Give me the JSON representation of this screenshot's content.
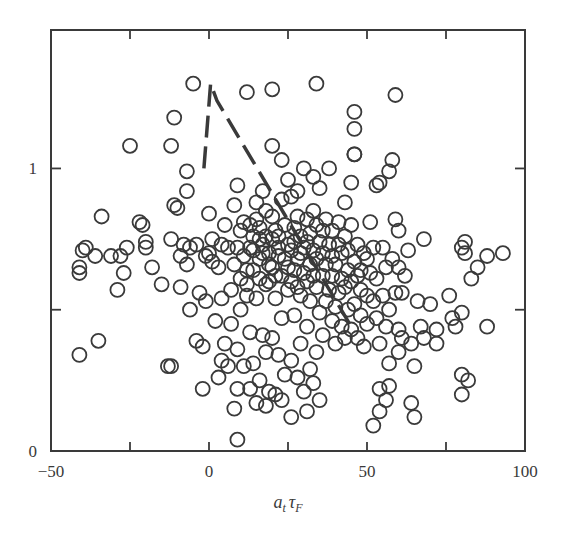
{
  "chart_data": {
    "type": "scatter",
    "title": "",
    "xlabel": "a_t τ_F",
    "xlabel_main": "a",
    "xlabel_sub1": "t",
    "xlabel_tau": "τ",
    "xlabel_sub2": "F",
    "ylabel": "",
    "xlim": [
      -50,
      100
    ],
    "ylim": [
      0,
      1.49
    ],
    "grid": false,
    "legend": null,
    "x_ticks": [
      -50,
      -25,
      0,
      25,
      50,
      75,
      100
    ],
    "x_tick_labels": [
      "-50",
      "",
      "0",
      "",
      "50",
      "",
      "100"
    ],
    "y_ticks": [
      0,
      0.5,
      1
    ],
    "y_tick_labels": [
      "0",
      "",
      "1"
    ],
    "marker": "open-circle",
    "marker_color": "#3a3a3a",
    "series": [
      {
        "name": "observations",
        "style": "open-circle",
        "points": [
          [
            -41,
            0.34
          ],
          [
            -35,
            0.39
          ],
          [
            -41,
            0.63
          ],
          [
            -41,
            0.65
          ],
          [
            -40,
            0.71
          ],
          [
            -39,
            0.72
          ],
          [
            -36,
            0.69
          ],
          [
            -34,
            0.83
          ],
          [
            -31,
            0.69
          ],
          [
            -29,
            0.57
          ],
          [
            -28,
            0.69
          ],
          [
            -27,
            0.63
          ],
          [
            -26,
            0.72
          ],
          [
            -25,
            1.08
          ],
          [
            -22,
            0.81
          ],
          [
            -21,
            0.8
          ],
          [
            -20,
            0.72
          ],
          [
            -20,
            0.74
          ],
          [
            -18,
            0.65
          ],
          [
            -15,
            0.59
          ],
          [
            -13,
            0.3
          ],
          [
            -12,
            0.3
          ],
          [
            -12,
            0.75
          ],
          [
            -12,
            1.08
          ],
          [
            -11,
            0.87
          ],
          [
            -11,
            1.18
          ],
          [
            -10,
            0.86
          ],
          [
            -9,
            0.58
          ],
          [
            -9,
            0.69
          ],
          [
            -8,
            0.73
          ],
          [
            -7,
            0.66
          ],
          [
            -7,
            0.92
          ],
          [
            -7,
            0.99
          ],
          [
            -6,
            0.5
          ],
          [
            -6,
            0.72
          ],
          [
            -5,
            1.3
          ],
          [
            -4,
            0.73
          ],
          [
            -4,
            0.39
          ],
          [
            -3,
            0.56
          ],
          [
            -2,
            0.22
          ],
          [
            -2,
            0.37
          ],
          [
            -1,
            0.53
          ],
          [
            -1,
            0.69
          ],
          [
            0,
            0.84
          ],
          [
            0,
            0.7
          ],
          [
            1,
            0.75
          ],
          [
            1,
            0.67
          ],
          [
            2,
            0.46
          ],
          [
            3,
            0.26
          ],
          [
            3,
            0.65
          ],
          [
            4,
            0.54
          ],
          [
            4,
            0.32
          ],
          [
            4,
            0.73
          ],
          [
            5,
            0.38
          ],
          [
            5,
            0.8
          ],
          [
            6,
            0.3
          ],
          [
            6,
            0.72
          ],
          [
            7,
            0.45
          ],
          [
            7,
            0.57
          ],
          [
            8,
            0.15
          ],
          [
            8,
            0.66
          ],
          [
            8,
            0.87
          ],
          [
            9,
            0.04
          ],
          [
            9,
            0.22
          ],
          [
            9,
            0.36
          ],
          [
            9,
            0.72
          ],
          [
            9,
            0.94
          ],
          [
            10,
            0.5
          ],
          [
            10,
            0.61
          ],
          [
            10,
            0.78
          ],
          [
            11,
            0.81
          ],
          [
            11,
            0.3
          ],
          [
            11,
            0.69
          ],
          [
            12,
            0.55
          ],
          [
            12,
            0.59
          ],
          [
            12,
            0.64
          ],
          [
            12,
            1.27
          ],
          [
            13,
            0.22
          ],
          [
            13,
            0.42
          ],
          [
            13,
            0.72
          ],
          [
            13,
            0.8
          ],
          [
            14,
            0.31
          ],
          [
            14,
            0.64
          ],
          [
            14,
            0.71
          ],
          [
            14,
            0.76
          ],
          [
            15,
            0.17
          ],
          [
            15,
            0.54
          ],
          [
            15,
            0.82
          ],
          [
            15,
            0.88
          ],
          [
            16,
            0.25
          ],
          [
            16,
            0.61
          ],
          [
            16,
            0.68
          ],
          [
            16,
            0.75
          ],
          [
            16,
            0.79
          ],
          [
            17,
            0.41
          ],
          [
            17,
            0.7
          ],
          [
            17,
            0.73
          ],
          [
            17,
            0.92
          ],
          [
            18,
            0.16
          ],
          [
            18,
            0.35
          ],
          [
            18,
            0.59
          ],
          [
            18,
            0.76
          ],
          [
            18,
            0.85
          ],
          [
            19,
            0.21
          ],
          [
            19,
            0.6
          ],
          [
            19,
            0.66
          ],
          [
            19,
            0.7
          ],
          [
            20,
            0.4
          ],
          [
            20,
            0.65
          ],
          [
            20,
            0.75
          ],
          [
            20,
            0.83
          ],
          [
            20,
            1.08
          ],
          [
            20,
            1.28
          ],
          [
            21,
            0.2
          ],
          [
            21,
            0.54
          ],
          [
            21,
            0.62
          ],
          [
            21,
            0.78
          ],
          [
            22,
            0.34
          ],
          [
            22,
            0.69
          ],
          [
            22,
            0.72
          ],
          [
            22,
            0.76
          ],
          [
            23,
            0.18
          ],
          [
            23,
            0.47
          ],
          [
            23,
            0.62
          ],
          [
            23,
            0.89
          ],
          [
            23,
            1.03
          ],
          [
            24,
            0.27
          ],
          [
            24,
            0.68
          ],
          [
            24,
            0.8
          ],
          [
            25,
            0.57
          ],
          [
            25,
            0.65
          ],
          [
            25,
            0.73
          ],
          [
            25,
            0.96
          ],
          [
            26,
            0.12
          ],
          [
            26,
            0.32
          ],
          [
            26,
            0.6
          ],
          [
            26,
            0.71
          ],
          [
            26,
            0.9
          ],
          [
            27,
            0.48
          ],
          [
            27,
            0.64
          ],
          [
            27,
            0.74
          ],
          [
            27,
            0.79
          ],
          [
            28,
            0.26
          ],
          [
            28,
            0.58
          ],
          [
            28,
            0.68
          ],
          [
            28,
            0.83
          ],
          [
            28,
            0.92
          ],
          [
            29,
            0.38
          ],
          [
            29,
            0.55
          ],
          [
            29,
            0.7
          ],
          [
            29,
            0.76
          ],
          [
            30,
            0.21
          ],
          [
            30,
            0.63
          ],
          [
            30,
            0.72
          ],
          [
            30,
            1.0
          ],
          [
            31,
            0.14
          ],
          [
            31,
            0.44
          ],
          [
            31,
            0.6
          ],
          [
            31,
            0.74
          ],
          [
            31,
            0.82
          ],
          [
            32,
            0.29
          ],
          [
            32,
            0.53
          ],
          [
            32,
            0.66
          ],
          [
            32,
            0.77
          ],
          [
            33,
            0.24
          ],
          [
            33,
            0.62
          ],
          [
            33,
            0.71
          ],
          [
            33,
            0.85
          ],
          [
            33,
            0.97
          ],
          [
            34,
            0.35
          ],
          [
            34,
            0.58
          ],
          [
            34,
            0.68
          ],
          [
            34,
            0.8
          ],
          [
            34,
            1.3
          ],
          [
            35,
            0.18
          ],
          [
            35,
            0.49
          ],
          [
            35,
            0.74
          ],
          [
            35,
            0.93
          ],
          [
            36,
            0.41
          ],
          [
            36,
            0.62
          ],
          [
            36,
            0.7
          ],
          [
            36,
            0.78
          ],
          [
            37,
            0.53
          ],
          [
            37,
            0.66
          ],
          [
            37,
            0.82
          ],
          [
            38,
            0.57
          ],
          [
            38,
            0.73
          ],
          [
            38,
            1.0
          ],
          [
            39,
            0.46
          ],
          [
            39,
            0.62
          ],
          [
            39,
            0.69
          ],
          [
            39,
            0.78
          ],
          [
            40,
            0.38
          ],
          [
            40,
            0.51
          ],
          [
            40,
            0.66
          ],
          [
            41,
            0.56
          ],
          [
            41,
            0.73
          ],
          [
            41,
            0.81
          ],
          [
            42,
            0.44
          ],
          [
            42,
            0.61
          ],
          [
            42,
            0.7
          ],
          [
            43,
            0.4
          ],
          [
            43,
            0.58
          ],
          [
            43,
            0.76
          ],
          [
            43,
            0.88
          ],
          [
            44,
            0.5
          ],
          [
            44,
            0.64
          ],
          [
            44,
            0.71
          ],
          [
            45,
            0.43
          ],
          [
            45,
            0.6
          ],
          [
            45,
            0.8
          ],
          [
            45,
            0.95
          ],
          [
            46,
            0.52
          ],
          [
            46,
            0.67
          ],
          [
            46,
            1.05
          ],
          [
            46,
            1.05
          ],
          [
            46,
            1.14
          ],
          [
            46,
            1.2
          ],
          [
            47,
            0.4
          ],
          [
            47,
            0.62
          ],
          [
            47,
            0.73
          ],
          [
            48,
            0.48
          ],
          [
            48,
            0.57
          ],
          [
            48,
            0.64
          ],
          [
            49,
            0.37
          ],
          [
            49,
            0.7
          ],
          [
            50,
            0.45
          ],
          [
            50,
            0.55
          ],
          [
            50,
            0.68
          ],
          [
            51,
            0.63
          ],
          [
            51,
            0.81
          ],
          [
            52,
            0.09
          ],
          [
            52,
            0.53
          ],
          [
            52,
            0.72
          ],
          [
            53,
            0.47
          ],
          [
            53,
            0.61
          ],
          [
            53,
            0.94
          ],
          [
            54,
            0.14
          ],
          [
            54,
            0.22
          ],
          [
            54,
            0.38
          ],
          [
            54,
            0.95
          ],
          [
            55,
            0.55
          ],
          [
            55,
            0.72
          ],
          [
            56,
            0.18
          ],
          [
            56,
            0.44
          ],
          [
            56,
            0.65
          ],
          [
            57,
            0.23
          ],
          [
            57,
            0.31
          ],
          [
            57,
            0.5
          ],
          [
            57,
            0.99
          ],
          [
            58,
            0.68
          ],
          [
            58,
            1.03
          ],
          [
            59,
            0.56
          ],
          [
            59,
            0.82
          ],
          [
            59,
            1.26
          ],
          [
            60,
            0.35
          ],
          [
            60,
            0.43
          ],
          [
            60,
            0.65
          ],
          [
            60,
            0.78
          ],
          [
            61,
            0.4
          ],
          [
            61,
            0.56
          ],
          [
            62,
            0.62
          ],
          [
            63,
            0.71
          ],
          [
            64,
            0.17
          ],
          [
            64,
            0.38
          ],
          [
            65,
            0.12
          ],
          [
            65,
            0.3
          ],
          [
            66,
            0.53
          ],
          [
            67,
            0.44
          ],
          [
            68,
            0.4
          ],
          [
            68,
            0.75
          ],
          [
            70,
            0.52
          ],
          [
            72,
            0.43
          ],
          [
            72,
            0.38
          ],
          [
            76,
            0.55
          ],
          [
            77,
            0.47
          ],
          [
            78,
            0.44
          ],
          [
            80,
            0.27
          ],
          [
            80,
            0.2
          ],
          [
            80,
            0.49
          ],
          [
            80,
            0.72
          ],
          [
            81,
            0.7
          ],
          [
            81,
            0.74
          ],
          [
            82,
            0.25
          ],
          [
            83,
            0.61
          ],
          [
            85,
            0.65
          ],
          [
            88,
            0.44
          ],
          [
            88,
            0.69
          ],
          [
            93,
            0.7
          ]
        ]
      },
      {
        "name": "trend",
        "style": "dashed-line",
        "points": [
          [
            -1.6,
            1.0
          ],
          [
            0.5,
            1.3
          ],
          [
            2.5,
            1.24
          ],
          [
            44.5,
            0.45
          ]
        ]
      }
    ]
  }
}
